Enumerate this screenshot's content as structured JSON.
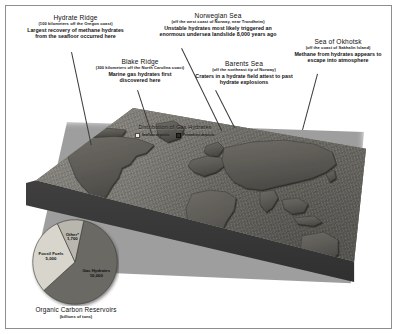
{
  "callouts": [
    {
      "id": "hydrate-ridge",
      "title": "Hydrate Ridge",
      "subtitle": "(100 kilometers off the Oregon coast)",
      "body": [
        "Largest recovery of methane hydrates",
        "from the seafloor occurred here"
      ]
    },
    {
      "id": "blake-ridge",
      "title": "Blake Ridge",
      "subtitle": "(300 kilometers off the North Carolina coast)",
      "body": [
        "Marine gas hydrates first",
        "discovered here"
      ]
    },
    {
      "id": "norwegian-sea",
      "title": "Norwegian Sea",
      "subtitle": "(off the west coast of Norway, near Trondheim)",
      "body": [
        "Unstable hydrates most likely triggered an",
        "enormous undersea landslide 8,000 years ago"
      ]
    },
    {
      "id": "barents-sea",
      "title": "Barents Sea",
      "subtitle": "(off the northeast tip of Norway)",
      "body": [
        "Craters in a hydrate field attest to past",
        "hydrate explosions"
      ]
    },
    {
      "id": "sea-of-okhotsk",
      "title": "Sea of Okhotsk",
      "subtitle": "(off the coast of Sakhalin Island)",
      "body": [
        "Methane from hydrates appears to",
        "escape into atmosphere"
      ]
    }
  ],
  "map": {
    "title": "Distribution of Gas Hydrates",
    "legend": [
      {
        "label": "Seafloor deposits",
        "color": "#efefe8"
      },
      {
        "label": "Permafrost deposits",
        "color": "#2f2f2c"
      }
    ]
  },
  "chart_data": {
    "type": "pie",
    "title": "Organic Carbon Reservoirs",
    "subtitle": "(billions of tons)",
    "unit": "billions of tons",
    "categories": [
      "Gas Hydrates",
      "Fossil Fuels",
      "Other*"
    ],
    "values": [
      10000,
      5000,
      1700
    ],
    "labels": [
      "10,000",
      "5,000",
      "1,700"
    ],
    "colors": [
      "#6b6963",
      "#d7d5cc",
      "#b9b7ad"
    ],
    "legend": "in-slice",
    "grid": false
  }
}
